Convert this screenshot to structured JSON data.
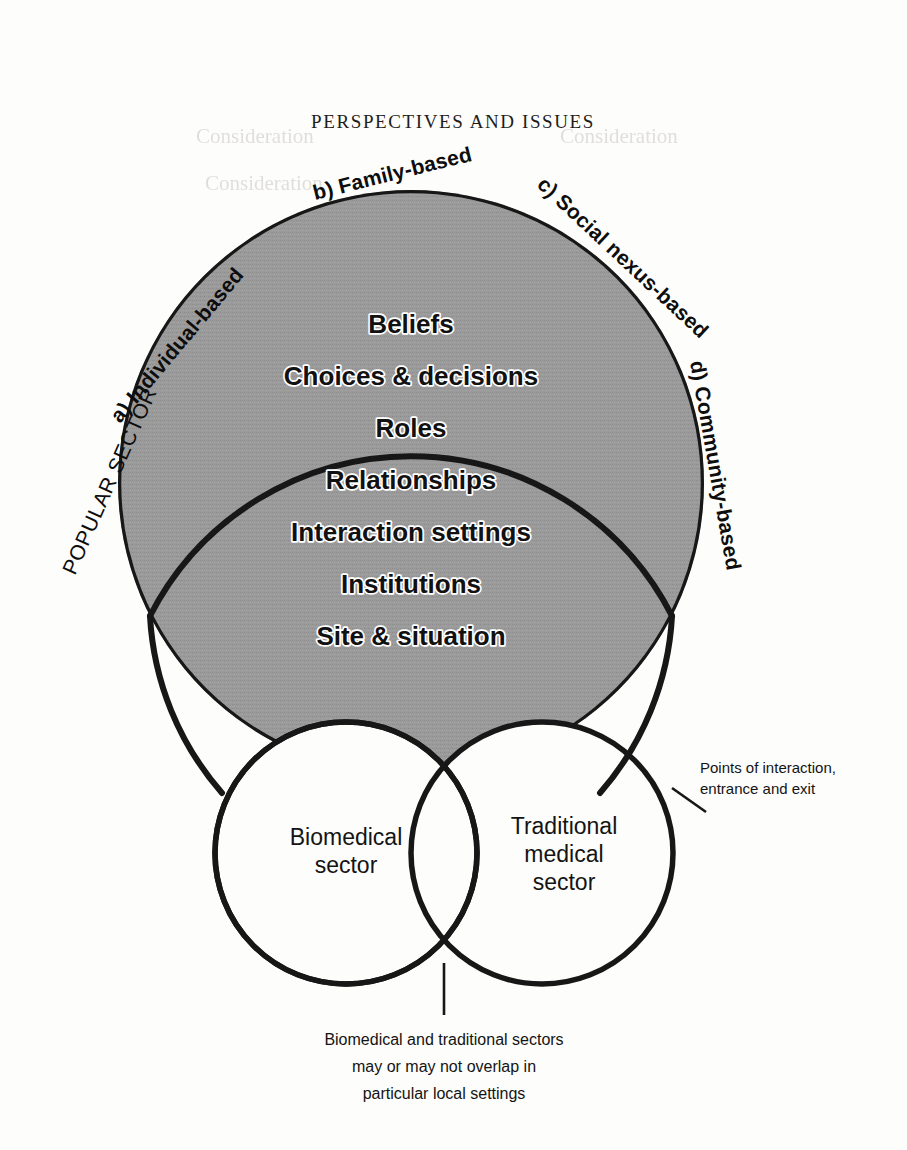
{
  "page": {
    "running_head": "PERSPECTIVES AND ISSUES",
    "background_color": "#fdfdfb",
    "sector_fill_color": "#9a9a9a",
    "outline_color": "#171717"
  },
  "popular_sector": {
    "label": "POPULAR SECTOR",
    "arc_labels": [
      {
        "id": "a",
        "text": "a) Individual-based"
      },
      {
        "id": "b",
        "text": "b) Family-based"
      },
      {
        "id": "c",
        "text": "c) Social nexus-based"
      },
      {
        "id": "d",
        "text": "d) Community-based"
      }
    ],
    "items": [
      "Beliefs",
      "Choices & decisions",
      "Roles",
      "Relationships",
      "Interaction settings",
      "Institutions",
      "Site & situation"
    ]
  },
  "sub_circles": [
    {
      "id": "biomedical",
      "lines": [
        "Biomedical",
        "sector"
      ]
    },
    {
      "id": "traditional",
      "lines": [
        "Traditional",
        "medical",
        "sector"
      ]
    }
  ],
  "annotations": {
    "points_of_interaction": {
      "lines": [
        "Points of interaction,",
        "entrance and exit"
      ]
    },
    "overlap_caption": {
      "lines": [
        "Biomedical and traditional sectors",
        "may or may not overlap in",
        "particular local settings"
      ]
    }
  },
  "bleed_through": {
    "lines": [
      "Consideration",
      "Consideration",
      "Consideration"
    ]
  }
}
